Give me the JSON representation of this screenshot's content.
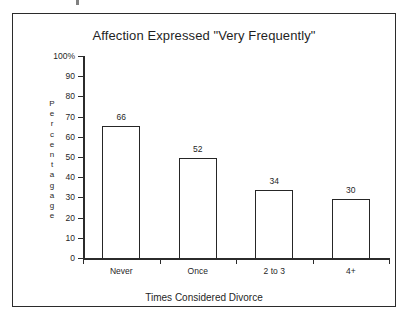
{
  "chart_data": {
    "type": "bar",
    "title": "Affection Expressed \"Very Frequently\"",
    "xlabel": "Times Considered Divorce",
    "ylabel": "Percentagage",
    "ylabel_chars": [
      "P",
      "e",
      "r",
      "c",
      "e",
      "n",
      "t",
      "a",
      "g",
      "a",
      "g",
      "e"
    ],
    "categories": [
      "Never",
      "Once",
      "2 to 3",
      "4+"
    ],
    "values": [
      66,
      52,
      34,
      30
    ],
    "value_labels": [
      "66",
      "52",
      "34",
      "30"
    ],
    "ylim": [
      0,
      100
    ],
    "ytick_values": [
      0,
      10,
      20,
      30,
      40,
      50,
      60,
      70,
      80,
      90,
      100
    ],
    "ytick_labels": [
      "0",
      "10",
      "20",
      "30",
      "40",
      "50",
      "60",
      "70",
      "80",
      "90",
      "100%"
    ],
    "grid": false,
    "legend": null,
    "bar_fill": "#ffffff",
    "bar_edge": "#262626",
    "axis_color": "#2b2b2b",
    "text_color": "#1f1f1f",
    "background": "#ffffff",
    "bar_render_heights": [
      65.5,
      49.5,
      33.5,
      29.0
    ]
  }
}
